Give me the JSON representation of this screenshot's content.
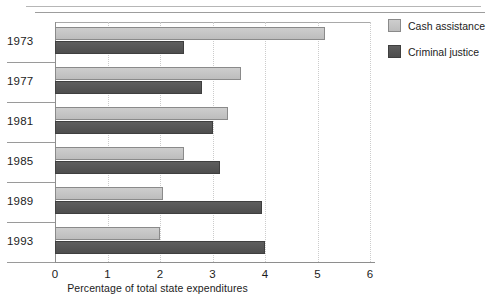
{
  "decor": {
    "top_ghost_text": "",
    "bottom_ghost_text": ""
  },
  "legend": {
    "position": "right",
    "items": [
      {
        "label": "Cash assistance",
        "color": "#c6c6c6",
        "swatch": "cash-swatch"
      },
      {
        "label": "Criminal justice",
        "color": "#575757",
        "swatch": "criminal-swatch"
      }
    ]
  },
  "chart_data": {
    "type": "bar",
    "orientation": "horizontal",
    "title": "",
    "subtitle": "",
    "xlabel": "Percentage of total state expenditures",
    "ylabel": "",
    "categories": [
      "1973",
      "1977",
      "1981",
      "1985",
      "1989",
      "1993"
    ],
    "series": [
      {
        "name": "Cash assistance",
        "color": "#c6c6c6",
        "values": [
          5.15,
          3.55,
          3.3,
          2.45,
          2.05,
          2.0
        ]
      },
      {
        "name": "Criminal justice",
        "color": "#575757",
        "values": [
          2.45,
          2.8,
          3.0,
          3.15,
          3.95,
          4.0
        ]
      }
    ],
    "xlim": [
      0,
      6
    ],
    "xticks": [
      "0",
      "1",
      "2",
      "3",
      "4",
      "5",
      "6"
    ],
    "grid": "vertical-dotted",
    "legend_position": "right"
  }
}
